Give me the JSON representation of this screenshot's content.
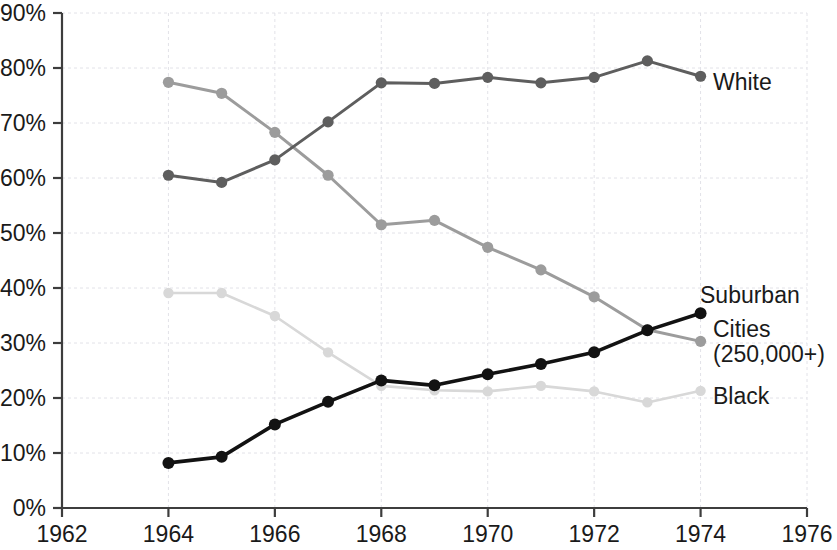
{
  "chart_data": {
    "type": "line",
    "title": "",
    "subtitle": "",
    "xlabel": "",
    "ylabel": "",
    "xlim": [
      1962,
      1976
    ],
    "ylim": [
      0,
      90
    ],
    "grid": true,
    "legend_position": "right-inline",
    "x_tick_labels": [
      "1962",
      "1964",
      "1966",
      "1968",
      "1970",
      "1972",
      "1974",
      "1976"
    ],
    "x_ticks": [
      1962,
      1964,
      1966,
      1968,
      1970,
      1972,
      1974,
      1976
    ],
    "y_tick_labels": [
      "0%",
      "10%",
      "20%",
      "30%",
      "40%",
      "50%",
      "60%",
      "70%",
      "80%",
      "90%"
    ],
    "y_ticks": [
      0,
      10,
      20,
      30,
      40,
      50,
      60,
      70,
      80,
      90
    ],
    "x": [
      1964,
      1965,
      1966,
      1967,
      1968,
      1969,
      1970,
      1971,
      1972,
      1973,
      1974
    ],
    "series": [
      {
        "name": "White",
        "label": "White",
        "color": "#5e5e5e",
        "values": [
          60.5,
          59.2,
          63.3,
          70.2,
          77.3,
          77.2,
          78.3,
          77.3,
          78.3,
          81.3,
          78.5
        ]
      },
      {
        "name": "Cities (250,000+)",
        "label": "Cities",
        "label_line2": "(250,000+)",
        "color": "#9c9c9c",
        "values": [
          77.4,
          75.4,
          68.3,
          60.5,
          51.5,
          52.3,
          47.4,
          43.3,
          38.4,
          32.4,
          30.3
        ]
      },
      {
        "name": "Suburban",
        "label": "Suburban",
        "color": "#121212",
        "values": [
          8.2,
          9.3,
          15.2,
          19.3,
          23.2,
          22.3,
          24.3,
          26.2,
          28.3,
          32.3,
          35.4
        ]
      },
      {
        "name": "Black",
        "label": "Black",
        "color": "#d8d8d8",
        "values": [
          39.1,
          39.1,
          34.9,
          28.3,
          22.2,
          21.4,
          21.2,
          22.2,
          21.2,
          19.2,
          21.3
        ]
      }
    ]
  },
  "series_labels": {
    "white": "White",
    "suburban": "Suburban",
    "cities_line1": "Cities",
    "cities_line2": "(250,000+)",
    "black": "Black"
  }
}
